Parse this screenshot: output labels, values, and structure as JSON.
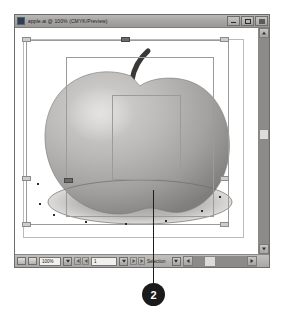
{
  "window": {
    "title": "apple.ai @ 100% (CMYK/Preview)",
    "app_icon": "illustrator-app-icon",
    "buttons": {
      "minimize": "minimize-button",
      "maximize": "maximize-button",
      "close": "close-button"
    }
  },
  "status_bar": {
    "zoom_value": "100%",
    "page_value": "1",
    "status_text": "Selection",
    "icons": [
      "page-info-icon",
      "layers-icon"
    ],
    "nav": [
      "first-page",
      "previous-page",
      "next-page",
      "last-page"
    ]
  },
  "artwork": {
    "name": "apple-illustration",
    "description": "Grayscale apple with stem and elliptical shadow",
    "selection": {
      "outer_box": "artwork-bounding-box",
      "inner_box": "inner-selection-box",
      "group_box": "group-selection-box",
      "handle_count": 8
    }
  },
  "callout": {
    "number": "2",
    "leader": "callout-leader-line"
  }
}
